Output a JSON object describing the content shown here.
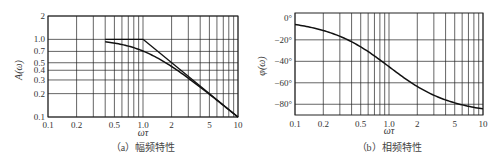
{
  "chart_data": [
    {
      "type": "line",
      "title": "",
      "caption": "（a）幅频特性",
      "xlabel": "ωτ",
      "ylabel": "A(ω)",
      "xscale": "log",
      "yscale": "log",
      "xlim": [
        0.1,
        10
      ],
      "ylim": [
        0.1,
        2
      ],
      "x_ticks": [
        "0.1",
        "0.2",
        "0.5",
        "1.0",
        "2",
        "5",
        "10"
      ],
      "y_ticks": [
        "0.1",
        "0.2",
        "0.3",
        "0.4",
        "0.5",
        "0.7",
        "1.0",
        "2"
      ],
      "grid": true,
      "series": [
        {
          "name": "A(ω) exact",
          "x": [
            0.4,
            0.5,
            0.7,
            1.0,
            1.5,
            2,
            3,
            4,
            5,
            7,
            10
          ],
          "y": [
            0.93,
            0.89,
            0.82,
            0.71,
            0.55,
            0.45,
            0.32,
            0.24,
            0.2,
            0.14,
            0.1
          ]
        },
        {
          "name": "asymptote",
          "x": [
            1.0,
            2,
            3,
            5,
            10
          ],
          "y": [
            1.0,
            0.5,
            0.33,
            0.2,
            0.1
          ]
        }
      ]
    },
    {
      "type": "line",
      "title": "",
      "caption": "（b）相频特性",
      "xlabel": "ωτ",
      "ylabel": "φ(ω)",
      "xscale": "log",
      "yscale": "linear",
      "xlim": [
        0.1,
        10
      ],
      "ylim": [
        -90,
        5
      ],
      "x_ticks": [
        "0.1",
        "0.2",
        "0.5",
        "1.0",
        "2",
        "5",
        "10"
      ],
      "y_ticks": [
        "0°",
        "−20°",
        "−40°",
        "−60°",
        "−80°"
      ],
      "grid": true,
      "series": [
        {
          "name": "φ(ω)",
          "x": [
            0.1,
            0.2,
            0.3,
            0.5,
            0.7,
            1.0,
            1.5,
            2,
            3,
            5,
            7,
            10
          ],
          "y": [
            -5.7,
            -11.3,
            -16.7,
            -26.6,
            -35.0,
            -45.0,
            -56.3,
            -63.4,
            -71.6,
            -78.7,
            -81.9,
            -84.3
          ]
        }
      ]
    }
  ],
  "labels": {
    "a_caption": "（a）幅频特性",
    "b_caption": "（b）相频特性",
    "a_xlabel": "ωτ",
    "b_xlabel": "ωτ",
    "a_ylabel": "A(ω)",
    "b_ylabel": "φ(ω)"
  },
  "colors": {
    "line": "#111111",
    "grid": "#222222",
    "text": "#333333"
  }
}
